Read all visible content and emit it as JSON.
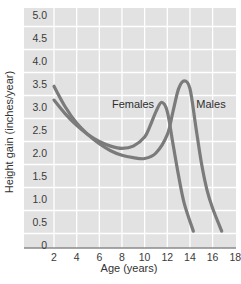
{
  "chart_data": {
    "type": "line",
    "title": "",
    "xlabel": "Age (years)",
    "ylabel": "Height gain (inches/year)",
    "xlim": [
      0,
      18
    ],
    "ylim": [
      0,
      5.0
    ],
    "grid": true,
    "legend": "inline labels",
    "x_ticks": [
      "2",
      "4",
      "6",
      "8",
      "10",
      "12",
      "14",
      "16",
      "18"
    ],
    "y_ticks": [
      "0",
      "0.5",
      "1.0",
      "1.5",
      "2.0",
      "2.5",
      "3.0",
      "3.5",
      "4.0",
      "4.5",
      "5.0"
    ],
    "series": [
      {
        "name": "Females",
        "x": [
          2,
          3,
          4,
          5,
          6,
          7,
          8,
          9,
          10,
          10.5,
          11,
          11.5,
          12,
          12.5,
          13,
          13.5,
          14.3
        ],
        "values": [
          3.15,
          2.85,
          2.6,
          2.4,
          2.25,
          2.15,
          2.1,
          2.15,
          2.35,
          2.6,
          2.9,
          3.1,
          2.9,
          2.2,
          1.5,
          0.9,
          0.3
        ]
      },
      {
        "name": "Males",
        "x": [
          2,
          3,
          4,
          5,
          6,
          7,
          8,
          9,
          10,
          11,
          12,
          12.5,
          13,
          13.5,
          14,
          14.5,
          15,
          15.5,
          16,
          16.8
        ],
        "values": [
          3.45,
          3.0,
          2.65,
          2.4,
          2.2,
          2.05,
          1.95,
          1.9,
          1.88,
          2.0,
          2.4,
          2.9,
          3.4,
          3.57,
          3.4,
          2.6,
          1.8,
          1.2,
          0.8,
          0.3
        ]
      }
    ],
    "annotations": [
      {
        "text": "Females",
        "x": 9.8,
        "y": 3.06
      },
      {
        "text": "Males",
        "x": 15.4,
        "y": 3.06
      }
    ]
  },
  "colors": {
    "plot_background": "#e2e2e2",
    "grid": "#ffffff",
    "curve": "#7b7b7b",
    "axis": "#8a8a8a",
    "text": "#333333"
  }
}
